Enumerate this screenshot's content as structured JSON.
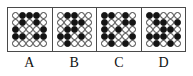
{
  "figure": {
    "type": "multiple-choice-pattern-grid",
    "grid_rows": 5,
    "grid_cols": 5,
    "colors": {
      "filled": "#141414",
      "empty": "#ffffff",
      "outline": "#3a3a3a",
      "frame": "#4a4a4a",
      "background": "#ffffff",
      "label_text": "#111111"
    },
    "legend": {
      "filled_token": "black-circle",
      "empty_token": "white-circle"
    }
  },
  "panels": [
    {
      "label": "A",
      "cells": [
        [
          "white",
          "black",
          "black",
          "black",
          "white"
        ],
        [
          "white",
          "black",
          "white",
          "black",
          "white"
        ],
        [
          "black",
          "white",
          "white",
          "white",
          "black"
        ],
        [
          "black",
          "black",
          "white",
          "black",
          "black"
        ],
        [
          "white",
          "white",
          "white",
          "white",
          "white"
        ]
      ]
    },
    {
      "label": "B",
      "cells": [
        [
          "white",
          "black",
          "black",
          "white",
          "white"
        ],
        [
          "white",
          "white",
          "black",
          "black",
          "white"
        ],
        [
          "white",
          "black",
          "black",
          "white",
          "white"
        ],
        [
          "black",
          "black",
          "white",
          "black",
          "white"
        ],
        [
          "white",
          "black",
          "white",
          "white",
          "white"
        ]
      ]
    },
    {
      "label": "C",
      "cells": [
        [
          "black",
          "black",
          "white",
          "black",
          "white"
        ],
        [
          "black",
          "white",
          "white",
          "black",
          "black"
        ],
        [
          "black",
          "white",
          "black",
          "white",
          "white"
        ],
        [
          "black",
          "black",
          "white",
          "white",
          "black"
        ],
        [
          "white",
          "black",
          "white",
          "black",
          "white"
        ]
      ]
    },
    {
      "label": "D",
      "cells": [
        [
          "black",
          "black",
          "white",
          "white",
          "white"
        ],
        [
          "white",
          "black",
          "black",
          "white",
          "black"
        ],
        [
          "white",
          "white",
          "black",
          "black",
          "white"
        ],
        [
          "black",
          "black",
          "black",
          "white",
          "black"
        ],
        [
          "white",
          "black",
          "white",
          "black",
          "white"
        ]
      ]
    }
  ]
}
